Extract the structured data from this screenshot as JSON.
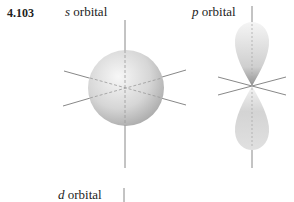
{
  "problem_number": "4.103",
  "figures": [
    {
      "id": "s",
      "letter": "s",
      "label": " orbital",
      "shape": "sphere"
    },
    {
      "id": "p",
      "letter": "p",
      "label": " orbital",
      "shape": "dumbbell"
    },
    {
      "id": "d",
      "letter": "d",
      "label": " orbital",
      "shape": "cloverleaf (cut off)"
    }
  ],
  "colors": {
    "axis": "#777777",
    "lobe_light": "#f2f2f2",
    "lobe_dark": "#a8a8a8"
  }
}
